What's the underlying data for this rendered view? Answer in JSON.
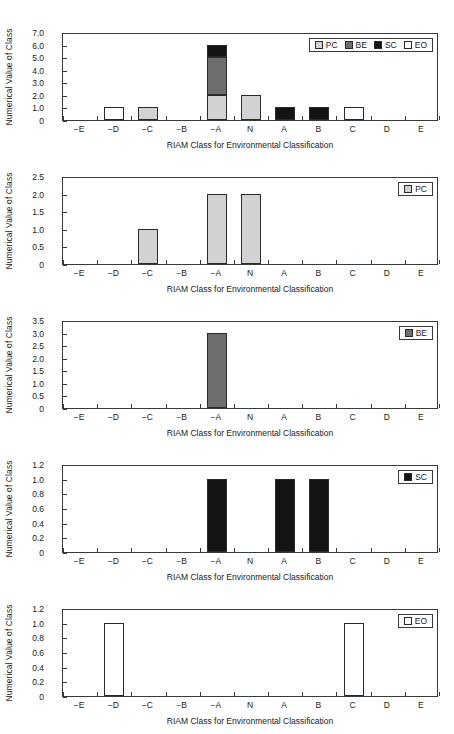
{
  "figure": {
    "width": 454,
    "height": 734,
    "background": "#ffffff",
    "axis_color": "#3a3a3a",
    "bar_edge_color": "#2b2b2b"
  },
  "series_colors": {
    "PC": "#d2d2d2",
    "BE": "#6e6e6e",
    "SC": "#141414",
    "EO": "#ffffff"
  },
  "common": {
    "categories": [
      "−E",
      "−D",
      "−C",
      "−B",
      "−A",
      "N",
      "A",
      "B",
      "C",
      "D",
      "E"
    ],
    "xlabel": "RIAM Class for Environmental Classification",
    "ylabel": "Numerical Value of Class"
  },
  "chart_data": [
    {
      "id": "panel-all",
      "type": "bar",
      "stacked": true,
      "title": "",
      "xlabel": "RIAM Class for Environmental Classification",
      "ylabel": "Numerical Value of Class",
      "categories": [
        "−E",
        "−D",
        "−C",
        "−B",
        "−A",
        "N",
        "A",
        "B",
        "C",
        "D",
        "E"
      ],
      "ylim": [
        0,
        7.0
      ],
      "yticks": [
        "0",
        "1.0",
        "2.0",
        "3.0",
        "4.0",
        "5.0",
        "6.0",
        "7.0"
      ],
      "ytick_values": [
        0,
        1,
        2,
        3,
        4,
        5,
        6,
        7
      ],
      "grid": false,
      "legend": [
        "PC",
        "BE",
        "SC",
        "EO"
      ],
      "legend_position": "top-right",
      "series": [
        {
          "name": "PC",
          "color": "#d2d2d2",
          "values": [
            0,
            0,
            1,
            0,
            2,
            2,
            0,
            0,
            0,
            0,
            0
          ]
        },
        {
          "name": "BE",
          "color": "#6e6e6e",
          "values": [
            0,
            0,
            0,
            0,
            3,
            0,
            0,
            0,
            0,
            0,
            0
          ]
        },
        {
          "name": "SC",
          "color": "#141414",
          "values": [
            0,
            0,
            0,
            0,
            1,
            0,
            1,
            1,
            0,
            0,
            0
          ]
        },
        {
          "name": "EO",
          "color": "#ffffff",
          "values": [
            0,
            1,
            0,
            0,
            0,
            0,
            0,
            0,
            1,
            0,
            0
          ]
        }
      ]
    },
    {
      "id": "panel-pc",
      "type": "bar",
      "stacked": false,
      "title": "",
      "xlabel": "RIAM Class for Environmental Classification",
      "ylabel": "Numerical Value of Class",
      "categories": [
        "−E",
        "−D",
        "−C",
        "−B",
        "−A",
        "N",
        "A",
        "B",
        "C",
        "D",
        "E"
      ],
      "ylim": [
        0,
        2.5
      ],
      "yticks": [
        "0",
        "0.5",
        "1.0",
        "1.5",
        "2.0",
        "2.5"
      ],
      "ytick_values": [
        0,
        0.5,
        1.0,
        1.5,
        2.0,
        2.5
      ],
      "grid": false,
      "legend": [
        "PC"
      ],
      "legend_position": "top-right",
      "series": [
        {
          "name": "PC",
          "color": "#d2d2d2",
          "values": [
            0,
            0,
            1,
            0,
            2,
            2,
            0,
            0,
            0,
            0,
            0
          ]
        }
      ]
    },
    {
      "id": "panel-be",
      "type": "bar",
      "stacked": false,
      "title": "",
      "xlabel": "RIAM Class for Environmental Classification",
      "ylabel": "Numerical Value of Class",
      "categories": [
        "−E",
        "−D",
        "−C",
        "−B",
        "−A",
        "N",
        "A",
        "B",
        "C",
        "D",
        "E"
      ],
      "ylim": [
        0,
        3.5
      ],
      "yticks": [
        "0",
        "0.5",
        "1.0",
        "1.5",
        "2.0",
        "2.5",
        "3.0",
        "3.5"
      ],
      "ytick_values": [
        0,
        0.5,
        1.0,
        1.5,
        2.0,
        2.5,
        3.0,
        3.5
      ],
      "grid": false,
      "legend": [
        "BE"
      ],
      "legend_position": "top-right",
      "series": [
        {
          "name": "BE",
          "color": "#6e6e6e",
          "values": [
            0,
            0,
            0,
            0,
            3,
            0,
            0,
            0,
            0,
            0,
            0
          ]
        }
      ]
    },
    {
      "id": "panel-sc",
      "type": "bar",
      "stacked": false,
      "title": "",
      "xlabel": "RIAM Class for Environmental Classification",
      "ylabel": "Numerical Value of Class",
      "categories": [
        "−E",
        "−D",
        "−C",
        "−B",
        "−A",
        "N",
        "A",
        "B",
        "C",
        "D",
        "E"
      ],
      "ylim": [
        0,
        1.2
      ],
      "yticks": [
        "0",
        "0.2",
        "0.4",
        "0.6",
        "0.8",
        "1.0",
        "1.2"
      ],
      "ytick_values": [
        0,
        0.2,
        0.4,
        0.6,
        0.8,
        1.0,
        1.2
      ],
      "grid": false,
      "legend": [
        "SC"
      ],
      "legend_position": "top-right",
      "series": [
        {
          "name": "SC",
          "color": "#141414",
          "values": [
            0,
            0,
            0,
            0,
            1,
            0,
            1,
            1,
            0,
            0,
            0
          ]
        }
      ]
    },
    {
      "id": "panel-eo",
      "type": "bar",
      "stacked": false,
      "title": "",
      "xlabel": "RIAM Class for Environmental Classification",
      "ylabel": "Numerical Value of Class",
      "categories": [
        "−E",
        "−D",
        "−C",
        "−B",
        "−A",
        "N",
        "A",
        "B",
        "C",
        "D",
        "E"
      ],
      "ylim": [
        0,
        1.2
      ],
      "yticks": [
        "0",
        "0.2",
        "0.4",
        "0.6",
        "0.8",
        "1.0",
        "1.2"
      ],
      "ytick_values": [
        0,
        0.2,
        0.4,
        0.6,
        0.8,
        1.0,
        1.2
      ],
      "grid": false,
      "legend": [
        "EO"
      ],
      "legend_position": "top-right",
      "series": [
        {
          "name": "EO",
          "color": "#ffffff",
          "values": [
            0,
            1,
            0,
            0,
            0,
            0,
            0,
            0,
            1,
            0,
            0
          ]
        }
      ]
    }
  ]
}
